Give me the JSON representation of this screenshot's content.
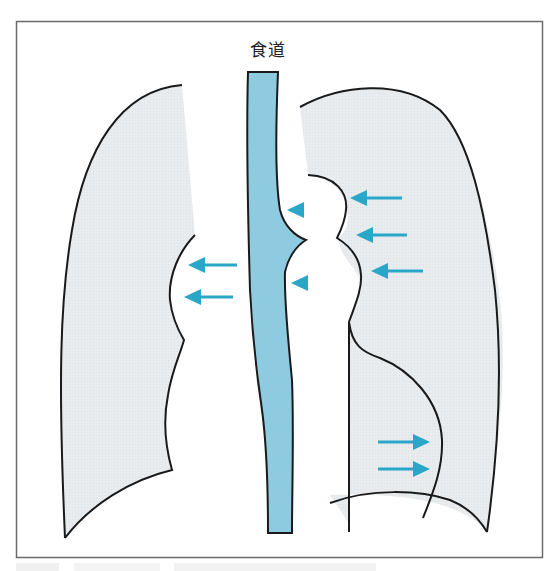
{
  "figure": {
    "esophagus_label": "食道",
    "caption": "",
    "colors": {
      "frame": "#6b6b6b",
      "outline": "#1a1a1a",
      "lung_fill": "#e9ecee",
      "esophagus_fill": "#8fcbe0",
      "arrow": "#2aa6c8",
      "background": "#ffffff"
    },
    "annotations": {
      "left_arrows": [
        {
          "direction": "left",
          "x1": 237,
          "x2": 188,
          "y": 265
        },
        {
          "direction": "left",
          "x1": 233,
          "x2": 184,
          "y": 297
        }
      ],
      "right_upper_arrows": [
        {
          "direction": "left",
          "x1": 402,
          "x2": 350,
          "y": 198
        },
        {
          "direction": "left",
          "x1": 407,
          "x2": 356,
          "y": 235
        },
        {
          "direction": "left",
          "x1": 423,
          "x2": 371,
          "y": 271
        }
      ],
      "right_lower_arrows": [
        {
          "direction": "right",
          "x1": 378,
          "x2": 430,
          "y": 442
        },
        {
          "direction": "right",
          "x1": 378,
          "x2": 430,
          "y": 469
        }
      ],
      "arrowheads": [
        {
          "direction": "left",
          "x": 287,
          "y": 210
        },
        {
          "direction": "left",
          "x": 291,
          "y": 283
        }
      ]
    }
  }
}
